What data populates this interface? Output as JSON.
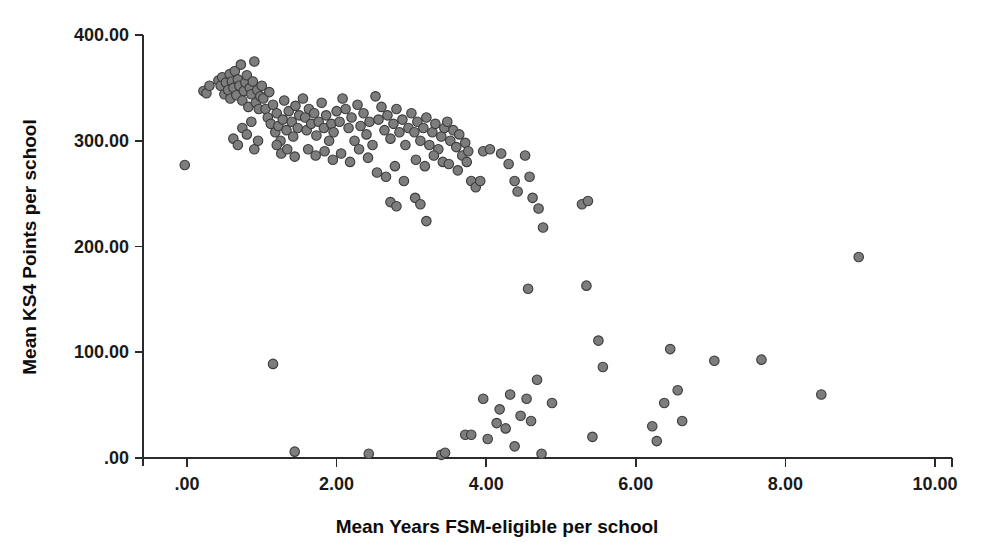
{
  "chart_data": {
    "type": "scatter",
    "title": "",
    "xlabel": "Mean Years FSM-eligible per school",
    "ylabel": "Mean KS4 Points per school",
    "xlim": [
      -0.55,
      10.7
    ],
    "ylim": [
      -12,
      432
    ],
    "grid": false,
    "legend": null,
    "marker": {
      "shape": "circle",
      "fill_color": "#7d7d7d",
      "edge_color": "#3b3b3b",
      "diameter_px": 9.5
    },
    "xticks": [
      0,
      2,
      4,
      6,
      8,
      10
    ],
    "xtick_labels": [
      ".00",
      "2.00",
      "4.00",
      "6.00",
      "8.00",
      "10.00"
    ],
    "yticks": [
      0,
      100,
      200,
      300,
      400
    ],
    "ytick_labels": [
      ".00",
      "100.00",
      "200.00",
      "300.00",
      "400.00"
    ],
    "n_points": 206,
    "points": [
      [
        -0.03,
        277
      ],
      [
        0.22,
        347
      ],
      [
        0.26,
        345
      ],
      [
        0.3,
        352
      ],
      [
        0.42,
        357
      ],
      [
        0.45,
        352
      ],
      [
        0.47,
        360
      ],
      [
        0.5,
        344
      ],
      [
        0.52,
        355
      ],
      [
        0.55,
        348
      ],
      [
        0.57,
        363
      ],
      [
        0.58,
        340
      ],
      [
        0.6,
        356
      ],
      [
        0.62,
        350
      ],
      [
        0.64,
        366
      ],
      [
        0.66,
        343
      ],
      [
        0.68,
        358
      ],
      [
        0.7,
        352
      ],
      [
        0.72,
        372
      ],
      [
        0.74,
        338
      ],
      [
        0.76,
        347
      ],
      [
        0.78,
        355
      ],
      [
        0.8,
        362
      ],
      [
        0.82,
        332
      ],
      [
        0.84,
        350
      ],
      [
        0.86,
        344
      ],
      [
        0.88,
        356
      ],
      [
        0.9,
        375
      ],
      [
        0.92,
        336
      ],
      [
        0.94,
        348
      ],
      [
        0.96,
        330
      ],
      [
        0.98,
        342
      ],
      [
        0.62,
        302
      ],
      [
        0.68,
        296
      ],
      [
        0.74,
        312
      ],
      [
        0.8,
        306
      ],
      [
        0.86,
        318
      ],
      [
        0.9,
        292
      ],
      [
        0.95,
        300
      ],
      [
        1.0,
        352
      ],
      [
        1.02,
        340
      ],
      [
        1.05,
        330
      ],
      [
        1.08,
        322
      ],
      [
        1.1,
        346
      ],
      [
        1.12,
        316
      ],
      [
        1.15,
        334
      ],
      [
        1.18,
        308
      ],
      [
        1.2,
        326
      ],
      [
        1.22,
        314
      ],
      [
        1.25,
        300
      ],
      [
        1.28,
        320
      ],
      [
        1.3,
        338
      ],
      [
        1.33,
        310
      ],
      [
        1.36,
        328
      ],
      [
        1.4,
        318
      ],
      [
        1.42,
        304
      ],
      [
        1.45,
        333
      ],
      [
        1.48,
        312
      ],
      [
        1.5,
        324
      ],
      [
        1.2,
        296
      ],
      [
        1.26,
        288
      ],
      [
        1.34,
        292
      ],
      [
        1.44,
        285
      ],
      [
        1.55,
        340
      ],
      [
        1.58,
        322
      ],
      [
        1.6,
        310
      ],
      [
        1.63,
        330
      ],
      [
        1.66,
        316
      ],
      [
        1.7,
        326
      ],
      [
        1.73,
        305
      ],
      [
        1.76,
        318
      ],
      [
        1.8,
        336
      ],
      [
        1.83,
        312
      ],
      [
        1.86,
        324
      ],
      [
        1.9,
        300
      ],
      [
        1.93,
        316
      ],
      [
        1.96,
        308
      ],
      [
        2.0,
        328
      ],
      [
        1.62,
        292
      ],
      [
        1.72,
        286
      ],
      [
        1.84,
        290
      ],
      [
        1.95,
        282
      ],
      [
        2.04,
        318
      ],
      [
        2.08,
        340
      ],
      [
        2.12,
        330
      ],
      [
        2.16,
        312
      ],
      [
        2.2,
        322
      ],
      [
        2.24,
        300
      ],
      [
        2.28,
        334
      ],
      [
        2.32,
        314
      ],
      [
        2.36,
        326
      ],
      [
        2.4,
        306
      ],
      [
        2.44,
        318
      ],
      [
        2.48,
        296
      ],
      [
        2.06,
        288
      ],
      [
        2.18,
        280
      ],
      [
        2.3,
        292
      ],
      [
        2.42,
        284
      ],
      [
        2.52,
        342
      ],
      [
        2.56,
        320
      ],
      [
        2.6,
        332
      ],
      [
        2.64,
        310
      ],
      [
        2.68,
        324
      ],
      [
        2.72,
        302
      ],
      [
        2.76,
        316
      ],
      [
        2.8,
        330
      ],
      [
        2.84,
        308
      ],
      [
        2.88,
        320
      ],
      [
        2.92,
        296
      ],
      [
        2.96,
        312
      ],
      [
        2.54,
        270
      ],
      [
        2.66,
        266
      ],
      [
        2.78,
        276
      ],
      [
        2.9,
        262
      ],
      [
        3.0,
        326
      ],
      [
        3.04,
        308
      ],
      [
        3.08,
        318
      ],
      [
        3.12,
        300
      ],
      [
        3.16,
        312
      ],
      [
        3.2,
        322
      ],
      [
        3.24,
        296
      ],
      [
        3.28,
        308
      ],
      [
        3.32,
        316
      ],
      [
        3.36,
        292
      ],
      [
        3.4,
        304
      ],
      [
        3.44,
        312
      ],
      [
        3.06,
        282
      ],
      [
        3.18,
        276
      ],
      [
        3.3,
        286
      ],
      [
        3.42,
        280
      ],
      [
        2.72,
        242
      ],
      [
        2.8,
        238
      ],
      [
        3.05,
        246
      ],
      [
        3.12,
        240
      ],
      [
        3.2,
        224
      ],
      [
        3.48,
        318
      ],
      [
        3.52,
        300
      ],
      [
        3.56,
        310
      ],
      [
        3.6,
        294
      ],
      [
        3.64,
        306
      ],
      [
        3.68,
        286
      ],
      [
        3.72,
        298
      ],
      [
        3.76,
        290
      ],
      [
        3.5,
        278
      ],
      [
        3.62,
        272
      ],
      [
        3.74,
        280
      ],
      [
        3.8,
        262
      ],
      [
        3.86,
        256
      ],
      [
        3.92,
        262
      ],
      [
        3.96,
        290
      ],
      [
        4.05,
        292
      ],
      [
        4.2,
        288
      ],
      [
        4.3,
        278
      ],
      [
        4.38,
        262
      ],
      [
        4.42,
        252
      ],
      [
        4.52,
        286
      ],
      [
        4.58,
        266
      ],
      [
        4.62,
        246
      ],
      [
        4.7,
        236
      ],
      [
        4.76,
        218
      ],
      [
        5.28,
        240
      ],
      [
        5.36,
        243
      ],
      [
        4.56,
        160
      ],
      [
        5.34,
        163
      ],
      [
        1.15,
        89
      ],
      [
        1.44,
        6
      ],
      [
        2.43,
        4
      ],
      [
        3.4,
        3
      ],
      [
        3.45,
        5
      ],
      [
        3.72,
        22
      ],
      [
        3.8,
        22
      ],
      [
        3.96,
        56
      ],
      [
        4.02,
        18
      ],
      [
        4.14,
        33
      ],
      [
        4.18,
        46
      ],
      [
        4.26,
        28
      ],
      [
        4.32,
        60
      ],
      [
        4.38,
        11
      ],
      [
        4.46,
        40
      ],
      [
        4.54,
        56
      ],
      [
        4.6,
        35
      ],
      [
        4.68,
        74
      ],
      [
        4.74,
        4
      ],
      [
        4.88,
        52
      ],
      [
        5.42,
        20
      ],
      [
        5.5,
        111
      ],
      [
        5.56,
        86
      ],
      [
        6.22,
        30
      ],
      [
        6.28,
        16
      ],
      [
        6.38,
        52
      ],
      [
        6.46,
        103
      ],
      [
        6.56,
        64
      ],
      [
        6.62,
        35
      ],
      [
        7.05,
        92
      ],
      [
        7.68,
        93
      ],
      [
        8.48,
        60
      ],
      [
        8.98,
        190
      ]
    ]
  },
  "axes": {
    "x_title": "Mean Years FSM-eligible per school",
    "y_title": "Mean KS4 Points per school",
    "x_tick_labels": [
      ".00",
      "2.00",
      "4.00",
      "6.00",
      "8.00",
      "10.00"
    ],
    "y_tick_labels": [
      "400.00",
      "300.00",
      "200.00",
      "100.00",
      ".00"
    ],
    "axis_color": "#2b2b2b",
    "background_color": "#ffffff"
  }
}
